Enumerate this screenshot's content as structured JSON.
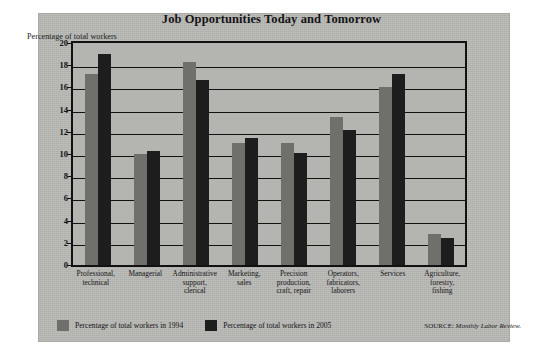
{
  "figure": {
    "title": "Job Opportunities Today and Tomorrow",
    "axis_note": "Percentage of total workers",
    "source_prefix": "SOURCE:",
    "source_name": "Monthly Labor Review."
  },
  "legend": {
    "items": [
      {
        "label": "Percentage of total workers in 1994",
        "color": "#6f6f6c"
      },
      {
        "label": "Percentage of total workers in 2005",
        "color": "#1d1d1d"
      }
    ]
  },
  "chart_data": {
    "type": "bar",
    "title": "Job Opportunities Today and Tomorrow",
    "xlabel": "",
    "ylabel": "Percentage of total workers",
    "ylim": [
      0,
      20
    ],
    "yticks": [
      0,
      2,
      4,
      6,
      8,
      10,
      12,
      14,
      16,
      18,
      20
    ],
    "grid": true,
    "legend_position": "bottom-left",
    "categories": [
      "Professional, technical",
      "Managerial",
      "Administrative support, clerical",
      "Marketing, sales",
      "Precision production, craft, repair",
      "Operators, fabricators, laborers",
      "Services",
      "Agriculture, forestry, fishing"
    ],
    "category_lines": [
      [
        "Professional,",
        "technical"
      ],
      [
        "Managerial"
      ],
      [
        "Administrative",
        "support,",
        "clerical"
      ],
      [
        "Marketing,",
        "sales"
      ],
      [
        "Precision",
        "production,",
        "craft, repair"
      ],
      [
        "Operators,",
        "fabricators,",
        "laborers"
      ],
      [
        "Services"
      ],
      [
        "Agriculture,",
        "forestry,",
        "fishing"
      ]
    ],
    "series": [
      {
        "name": "Percentage of total workers in 1994",
        "color": "#6f6f6c",
        "values": [
          17.2,
          10.0,
          18.3,
          11.0,
          11.0,
          13.3,
          16.0,
          2.8
        ]
      },
      {
        "name": "Percentage of total workers in 2005",
        "color": "#1d1d1d",
        "values": [
          19.0,
          10.3,
          16.7,
          11.4,
          10.1,
          12.2,
          17.2,
          2.4
        ]
      }
    ]
  }
}
